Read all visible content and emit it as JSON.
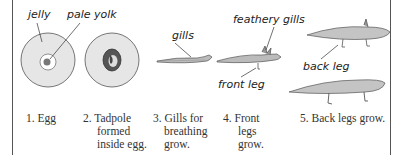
{
  "labels": {
    "jelly": "jelly",
    "pale_yolk": "pale yolk",
    "gills": "gills",
    "feathery_gills": "feathery gills",
    "front_leg": "front leg",
    "back_leg": "back leg"
  },
  "stages": [
    {
      "number": "1.",
      "caption_lines": [
        "Egg"
      ]
    },
    {
      "number": "2.",
      "caption_lines": [
        "Tadpole",
        "formed",
        "inside egg."
      ]
    },
    {
      "number": "3.",
      "caption_lines": [
        "Gills for",
        "breathing",
        "grow."
      ]
    },
    {
      "number": "4.",
      "caption_lines": [
        "Front",
        "legs",
        "grow."
      ]
    },
    {
      "number": "5.",
      "caption_lines": [
        "Back legs grow."
      ]
    }
  ],
  "captions": {
    "s1": "1. Egg",
    "s2_l1": "2. Tadpole",
    "s2_l2": "formed",
    "s2_l3": "inside egg.",
    "s3_l1": "3. Gills for",
    "s3_l2": "breathing",
    "s3_l3": "grow.",
    "s4_l1": "4. Front",
    "s4_l2": "legs",
    "s4_l3": "grow.",
    "s5": "5. Back legs grow."
  }
}
